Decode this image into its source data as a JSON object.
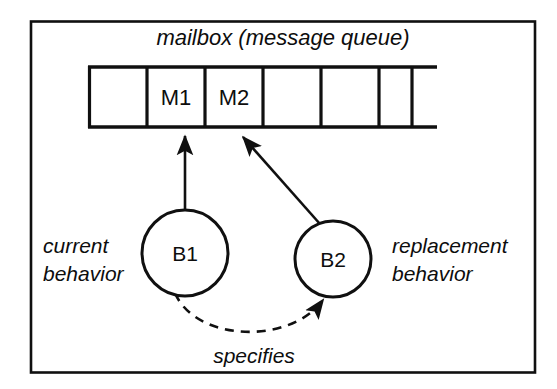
{
  "figure": {
    "title": "mailbox (message queue)",
    "edge_label": "specifies",
    "frame_color": "#101010",
    "background_color": "#ffffff",
    "stroke_color": "#101010"
  },
  "queue": {
    "name": "mailbox (message queue)",
    "cells": [
      {
        "id": "cell-0",
        "label": ""
      },
      {
        "id": "cell-1",
        "label": "M1"
      },
      {
        "id": "cell-2",
        "label": "M2"
      },
      {
        "id": "cell-3",
        "label": ""
      },
      {
        "id": "cell-4",
        "label": ""
      },
      {
        "id": "cell-5",
        "label": ""
      }
    ]
  },
  "nodes": [
    {
      "id": "B1",
      "label": "B1",
      "caption_line1": "current",
      "caption_line2": "behavior",
      "caption_side": "left"
    },
    {
      "id": "B2",
      "label": "B2",
      "caption_line1": "replacement",
      "caption_line2": "behavior",
      "caption_side": "right"
    }
  ],
  "arrows": [
    {
      "id": "arrow-b1-to-m1",
      "from": "B1",
      "to": "M1",
      "style": "solid"
    },
    {
      "id": "arrow-b2-to-m2",
      "from": "B2",
      "to": "M2",
      "style": "solid"
    },
    {
      "id": "arrow-b1-to-b2",
      "from": "B1",
      "to": "B2",
      "style": "dashed",
      "label": "specifies"
    }
  ]
}
